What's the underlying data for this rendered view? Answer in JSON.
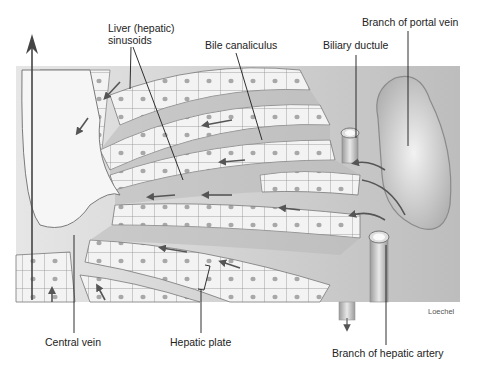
{
  "figure": {
    "labels": {
      "sinusoids_line1": "Liver (hepatic)",
      "sinusoids_line2": "sinusoids",
      "bile_canaliculus": "Bile canaliculus",
      "biliary_ductule": "Biliary ductule",
      "portal_vein": "Branch of portal vein",
      "central_vein": "Central vein",
      "hepatic_plate": "Hepatic plate",
      "hepatic_artery": "Branch of hepatic artery"
    },
    "credit": "Loechel",
    "colors": {
      "background": "#ffffff",
      "tissue_light": "#ececec",
      "tissue_mid": "#c8c8c8",
      "tissue_dark": "#9a9a9a",
      "cell_fill": "#f4f4f4",
      "cell_outline": "#8a8a8a",
      "nucleus": "#a9a9a9",
      "arrow": "#555555",
      "leader_line": "#1a1a1a"
    }
  }
}
